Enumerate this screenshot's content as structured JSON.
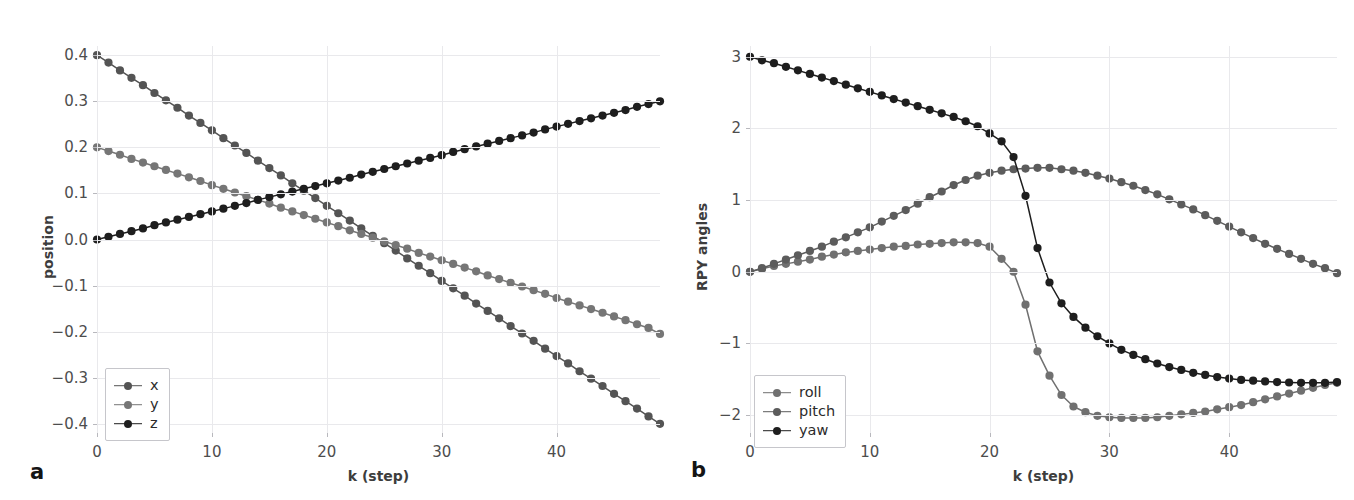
{
  "figure": {
    "background": "#ffffff",
    "panels": [
      {
        "letter": "a",
        "xlabel": "k (step)",
        "ylabel": "position",
        "xticks": [
          "0",
          "10",
          "20",
          "30",
          "40"
        ],
        "yticks": [
          "0.4",
          "0.3",
          "0.2",
          "0.1",
          "0.0",
          "−0.1",
          "−0.2",
          "−0.3",
          "−0.4"
        ],
        "legend": [
          {
            "label": "x",
            "color": "#545454"
          },
          {
            "label": "y",
            "color": "#767676"
          },
          {
            "label": "z",
            "color": "#1e1e1e"
          }
        ]
      },
      {
        "letter": "b",
        "xlabel": "k (step)",
        "ylabel": "RPY angles",
        "xticks": [
          "0",
          "10",
          "20",
          "30",
          "40"
        ],
        "yticks": [
          "3",
          "2",
          "1",
          "0",
          "−1",
          "−2"
        ],
        "legend": [
          {
            "label": "roll",
            "color": "#707070"
          },
          {
            "label": "pitch",
            "color": "#5c5c5c"
          },
          {
            "label": "yaw",
            "color": "#1e1e1e"
          }
        ]
      }
    ]
  },
  "chart_data": [
    {
      "type": "line",
      "panel": "a",
      "title": "",
      "xlabel": "k (step)",
      "ylabel": "position",
      "xlim": [
        0,
        49
      ],
      "ylim": [
        -0.42,
        0.42
      ],
      "xticks": [
        0,
        10,
        20,
        30,
        40
      ],
      "yticks": [
        0.4,
        0.3,
        0.2,
        0.1,
        0.0,
        -0.1,
        -0.2,
        -0.3,
        -0.4
      ],
      "grid": true,
      "markers": "circle",
      "legend_position": "lower-left",
      "x": [
        0,
        1,
        2,
        3,
        4,
        5,
        6,
        7,
        8,
        9,
        10,
        11,
        12,
        13,
        14,
        15,
        16,
        17,
        18,
        19,
        20,
        21,
        22,
        23,
        24,
        25,
        26,
        27,
        28,
        29,
        30,
        31,
        32,
        33,
        34,
        35,
        36,
        37,
        38,
        39,
        40,
        41,
        42,
        43,
        44,
        45,
        46,
        47,
        48,
        49
      ],
      "series": [
        {
          "name": "x",
          "color": "#545454",
          "values": [
            0.4,
            0.384,
            0.367,
            0.351,
            0.335,
            0.318,
            0.302,
            0.286,
            0.269,
            0.253,
            0.237,
            0.22,
            0.204,
            0.188,
            0.171,
            0.155,
            0.139,
            0.122,
            0.106,
            0.09,
            0.073,
            0.057,
            0.041,
            0.024,
            0.008,
            -0.008,
            -0.024,
            -0.041,
            -0.057,
            -0.073,
            -0.09,
            -0.106,
            -0.122,
            -0.139,
            -0.155,
            -0.171,
            -0.188,
            -0.204,
            -0.22,
            -0.237,
            -0.253,
            -0.269,
            -0.286,
            -0.302,
            -0.318,
            -0.335,
            -0.351,
            -0.367,
            -0.384,
            -0.4
          ]
        },
        {
          "name": "y",
          "color": "#767676",
          "values": [
            0.2,
            0.192,
            0.184,
            0.175,
            0.167,
            0.159,
            0.151,
            0.143,
            0.135,
            0.127,
            0.118,
            0.11,
            0.102,
            0.094,
            0.086,
            0.078,
            0.069,
            0.061,
            0.053,
            0.045,
            0.037,
            0.029,
            0.02,
            0.012,
            0.004,
            -0.004,
            -0.012,
            -0.02,
            -0.029,
            -0.037,
            -0.045,
            -0.053,
            -0.061,
            -0.069,
            -0.078,
            -0.086,
            -0.094,
            -0.102,
            -0.11,
            -0.118,
            -0.127,
            -0.135,
            -0.143,
            -0.151,
            -0.159,
            -0.167,
            -0.175,
            -0.184,
            -0.192,
            -0.205
          ]
        },
        {
          "name": "z",
          "color": "#1e1e1e",
          "values": [
            0.0,
            0.006,
            0.012,
            0.018,
            0.024,
            0.031,
            0.037,
            0.043,
            0.049,
            0.055,
            0.061,
            0.067,
            0.073,
            0.079,
            0.086,
            0.092,
            0.098,
            0.104,
            0.11,
            0.116,
            0.122,
            0.128,
            0.134,
            0.141,
            0.147,
            0.153,
            0.159,
            0.165,
            0.171,
            0.177,
            0.183,
            0.19,
            0.196,
            0.202,
            0.208,
            0.214,
            0.22,
            0.226,
            0.232,
            0.239,
            0.245,
            0.251,
            0.257,
            0.263,
            0.269,
            0.275,
            0.281,
            0.288,
            0.294,
            0.3
          ]
        }
      ]
    },
    {
      "type": "line",
      "panel": "b",
      "title": "",
      "xlabel": "k (step)",
      "ylabel": "RPY angles",
      "xlim": [
        0,
        49
      ],
      "ylim": [
        -2.25,
        3.15
      ],
      "xticks": [
        0,
        10,
        20,
        30,
        40
      ],
      "yticks": [
        3,
        2,
        1,
        0,
        -1,
        -2
      ],
      "grid": true,
      "markers": "circle",
      "legend_position": "lower-left",
      "x": [
        0,
        1,
        2,
        3,
        4,
        5,
        6,
        7,
        8,
        9,
        10,
        11,
        12,
        13,
        14,
        15,
        16,
        17,
        18,
        19,
        20,
        21,
        22,
        23,
        24,
        25,
        26,
        27,
        28,
        29,
        30,
        31,
        32,
        33,
        34,
        35,
        36,
        37,
        38,
        39,
        40,
        41,
        42,
        43,
        44,
        45,
        46,
        47,
        48,
        49
      ],
      "series": [
        {
          "name": "roll",
          "color": "#707070",
          "values": [
            0.0,
            0.04,
            0.08,
            0.11,
            0.14,
            0.17,
            0.21,
            0.24,
            0.27,
            0.29,
            0.31,
            0.33,
            0.35,
            0.36,
            0.38,
            0.39,
            0.4,
            0.41,
            0.41,
            0.4,
            0.35,
            0.18,
            0.0,
            -0.46,
            -1.11,
            -1.45,
            -1.72,
            -1.88,
            -1.96,
            -2.01,
            -2.03,
            -2.04,
            -2.04,
            -2.04,
            -2.03,
            -2.01,
            -1.99,
            -1.97,
            -1.95,
            -1.92,
            -1.89,
            -1.86,
            -1.82,
            -1.78,
            -1.74,
            -1.7,
            -1.66,
            -1.62,
            -1.58,
            -1.55
          ]
        },
        {
          "name": "pitch",
          "color": "#5c5c5c",
          "values": [
            0.0,
            0.05,
            0.11,
            0.17,
            0.23,
            0.29,
            0.35,
            0.42,
            0.48,
            0.55,
            0.62,
            0.7,
            0.78,
            0.86,
            0.95,
            1.04,
            1.12,
            1.21,
            1.28,
            1.34,
            1.38,
            1.41,
            1.43,
            1.44,
            1.45,
            1.45,
            1.43,
            1.41,
            1.38,
            1.34,
            1.3,
            1.25,
            1.2,
            1.14,
            1.08,
            1.01,
            0.94,
            0.87,
            0.79,
            0.71,
            0.63,
            0.55,
            0.47,
            0.39,
            0.32,
            0.25,
            0.18,
            0.11,
            0.05,
            -0.02
          ]
        },
        {
          "name": "yaw",
          "color": "#1e1e1e",
          "values": [
            3.0,
            2.95,
            2.91,
            2.86,
            2.81,
            2.76,
            2.71,
            2.66,
            2.61,
            2.56,
            2.51,
            2.46,
            2.41,
            2.36,
            2.31,
            2.26,
            2.21,
            2.16,
            2.1,
            2.03,
            1.93,
            1.82,
            1.6,
            1.06,
            0.33,
            -0.15,
            -0.44,
            -0.63,
            -0.78,
            -0.9,
            -1.0,
            -1.09,
            -1.16,
            -1.22,
            -1.28,
            -1.33,
            -1.37,
            -1.41,
            -1.44,
            -1.47,
            -1.49,
            -1.51,
            -1.52,
            -1.53,
            -1.54,
            -1.545,
            -1.55,
            -1.55,
            -1.55,
            -1.54
          ]
        }
      ]
    }
  ]
}
